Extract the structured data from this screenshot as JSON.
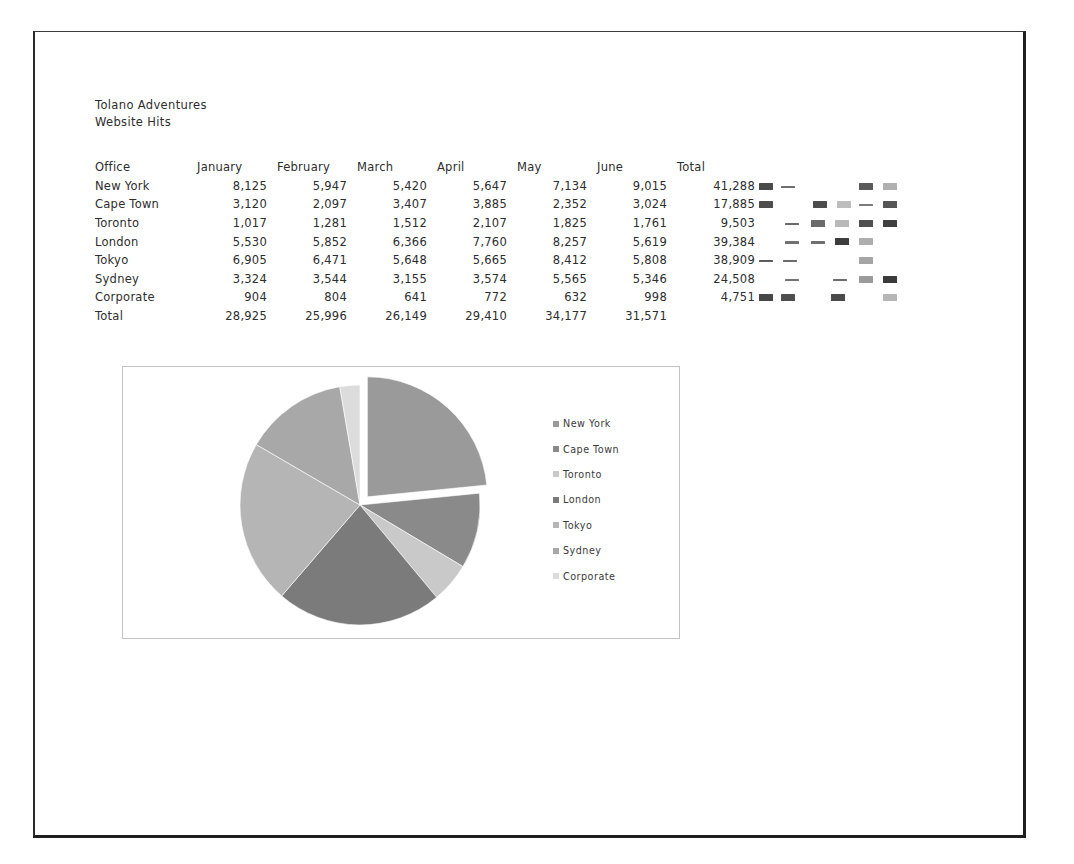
{
  "document": {
    "title_line1": "Tolano Adventures",
    "title_line2": "Website Hits"
  },
  "table": {
    "headers": [
      "Office",
      "January",
      "February",
      "March",
      "April",
      "May",
      "June",
      "Total"
    ],
    "rows": [
      {
        "office": "New York",
        "january": "8,125",
        "february": "5,947",
        "march": "5,420",
        "april": "5,647",
        "may": "7,134",
        "june": "9,015",
        "total": "41,288"
      },
      {
        "office": "Cape Town",
        "january": "3,120",
        "february": "2,097",
        "march": "3,407",
        "april": "3,885",
        "may": "2,352",
        "june": "3,024",
        "total": "17,885"
      },
      {
        "office": "Toronto",
        "january": "1,017",
        "february": "1,281",
        "march": "1,512",
        "april": "2,107",
        "may": "1,825",
        "june": "1,761",
        "total": "9,503"
      },
      {
        "office": "London",
        "january": "5,530",
        "february": "5,852",
        "march": "6,366",
        "april": "7,760",
        "may": "8,257",
        "june": "5,619",
        "total": "39,384"
      },
      {
        "office": "Tokyo",
        "january": "6,905",
        "february": "6,471",
        "march": "5,648",
        "april": "5,665",
        "may": "8,412",
        "june": "5,808",
        "total": "38,909"
      },
      {
        "office": "Sydney",
        "january": "3,324",
        "february": "3,544",
        "march": "3,155",
        "april": "3,574",
        "may": "5,565",
        "june": "5,346",
        "total": "24,508"
      },
      {
        "office": "Corporate",
        "january": "904",
        "february": "804",
        "march": "641",
        "april": "772",
        "may": "632",
        "june": "998",
        "total": "4,751"
      }
    ],
    "total_row": {
      "office": "Total",
      "january": "28,925",
      "february": "25,996",
      "march": "26,149",
      "april": "29,410",
      "may": "34,177",
      "june": "31,571",
      "total": ""
    }
  },
  "chart_data": {
    "type": "pie",
    "title": "",
    "categories": [
      "New York",
      "Cape Town",
      "Toronto",
      "London",
      "Tokyo",
      "Sydney",
      "Corporate"
    ],
    "values": [
      41288,
      17885,
      9503,
      39384,
      38909,
      24508,
      4751
    ],
    "value_label": "Total Website Hits",
    "legend_position": "right",
    "exploded_slice": "New York",
    "start_angle_deg": 0,
    "colors": [
      "#9a9a9a",
      "#8a8a8a",
      "#c9c9c9",
      "#7b7b7b",
      "#b5b5b5",
      "#a8a8a8",
      "#dcdcdc"
    ]
  },
  "legend": {
    "items": [
      {
        "label": "New York",
        "color": "#9a9a9a"
      },
      {
        "label": "Cape Town",
        "color": "#8a8a8a"
      },
      {
        "label": "Toronto",
        "color": "#c9c9c9"
      },
      {
        "label": "London",
        "color": "#7b7b7b"
      },
      {
        "label": "Tokyo",
        "color": "#b5b5b5"
      },
      {
        "label": "Sydney",
        "color": "#a8a8a8"
      },
      {
        "label": "Corporate",
        "color": "#dcdcdc"
      }
    ]
  },
  "marks": {
    "rows": [
      [
        {
          "x": 0,
          "t": "blk",
          "c": "#4a4a4a"
        },
        {
          "x": 22,
          "t": "dash",
          "c": "#6f6f6f"
        },
        {
          "x": 100,
          "t": "blk",
          "c": "#5a5a5a"
        },
        {
          "x": 124,
          "t": "blk",
          "c": "#b0b0b0"
        }
      ],
      [
        {
          "x": 0,
          "t": "blk",
          "c": "#4e4e4e"
        },
        {
          "x": 54,
          "t": "blk",
          "c": "#4c4c4c"
        },
        {
          "x": 78,
          "t": "blk",
          "c": "#bdbdbd"
        },
        {
          "x": 100,
          "t": "dash",
          "c": "#7a7a7a"
        },
        {
          "x": 124,
          "t": "blk",
          "c": "#555555"
        }
      ],
      [
        {
          "x": 26,
          "t": "dash",
          "c": "#6a6a6a"
        },
        {
          "x": 52,
          "t": "blk",
          "c": "#6a6a6a"
        },
        {
          "x": 76,
          "t": "blk",
          "c": "#b8b8b8"
        },
        {
          "x": 100,
          "t": "blk",
          "c": "#4f4f4f"
        },
        {
          "x": 124,
          "t": "blk",
          "c": "#3f3f3f"
        }
      ],
      [
        {
          "x": 26,
          "t": "dash",
          "c": "#707070"
        },
        {
          "x": 52,
          "t": "dash",
          "c": "#707070"
        },
        {
          "x": 76,
          "t": "blk",
          "c": "#3d3d3d"
        },
        {
          "x": 100,
          "t": "blk",
          "c": "#aeaeae"
        }
      ],
      [
        {
          "x": 0,
          "t": "dash",
          "c": "#5c5c5c"
        },
        {
          "x": 24,
          "t": "dash",
          "c": "#6c6c6c"
        },
        {
          "x": 100,
          "t": "blk",
          "c": "#a5a5a5"
        }
      ],
      [
        {
          "x": 26,
          "t": "dash",
          "c": "#757575"
        },
        {
          "x": 74,
          "t": "dash",
          "c": "#6e6e6e"
        },
        {
          "x": 100,
          "t": "blk",
          "c": "#9b9b9b"
        },
        {
          "x": 124,
          "t": "blk",
          "c": "#3a3a3a"
        }
      ],
      [
        {
          "x": 0,
          "t": "blk",
          "c": "#474747"
        },
        {
          "x": 22,
          "t": "blk",
          "c": "#4d4d4d"
        },
        {
          "x": 72,
          "t": "blk",
          "c": "#4a4a4a"
        },
        {
          "x": 124,
          "t": "blk",
          "c": "#b6b6b6"
        }
      ]
    ]
  }
}
